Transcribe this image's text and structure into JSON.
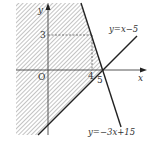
{
  "figure": {
    "axes": {
      "x_label": "x",
      "y_label": "y",
      "origin_label": "O"
    },
    "ticks": {
      "x_4": "4",
      "x_5": "5",
      "y_3": "3"
    },
    "lines": [
      {
        "label": "y = x − 5",
        "text": "y=x−5",
        "slope": 1,
        "intercept": -5
      },
      {
        "label": "y = −3x + 15",
        "text": "y=−3x+15",
        "slope": -3,
        "intercept": 15
      }
    ],
    "intersection_point": {
      "x": 4,
      "y": 3
    },
    "x_intercept": {
      "x": 5,
      "y": 0
    },
    "shaded_region": "hatched region left of y=−3x+15 and above y=x−5",
    "colors": {
      "line": "#222222",
      "hatch": "#9a9a9a",
      "axis": "#444444",
      "dashed": "#555555"
    }
  }
}
